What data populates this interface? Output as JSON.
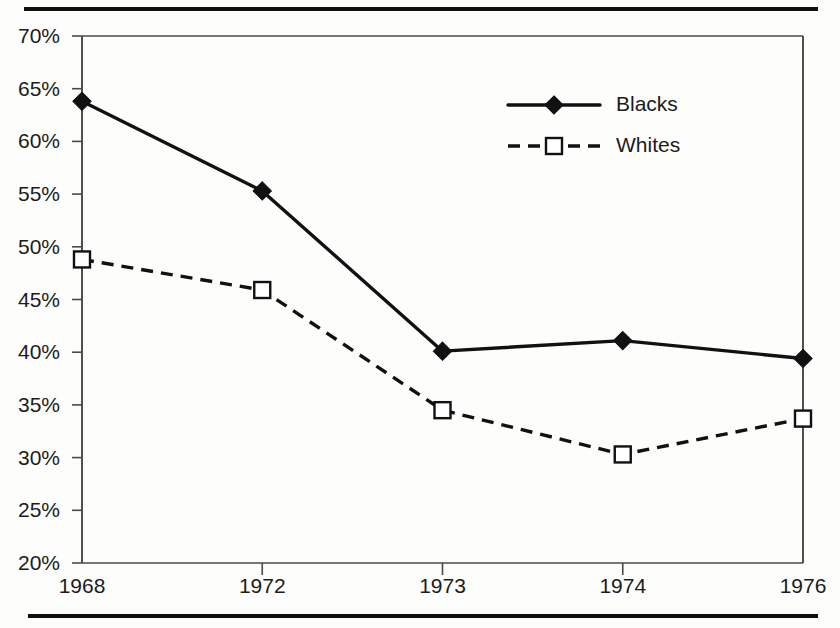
{
  "chart_data": {
    "type": "line",
    "title": "",
    "xlabel": "",
    "ylabel": "",
    "categories": [
      "1968",
      "1972",
      "1973",
      "1974",
      "1976"
    ],
    "series": [
      {
        "name": "Blacks",
        "values": [
          63.8,
          55.3,
          40.1,
          41.1,
          39.4
        ],
        "line_style": "solid",
        "marker": "filled-diamond",
        "color": "#111111"
      },
      {
        "name": "Whites",
        "values": [
          48.8,
          45.9,
          34.5,
          30.3,
          33.7
        ],
        "line_style": "dashed",
        "marker": "open-square",
        "color": "#111111"
      }
    ],
    "ylim": [
      20,
      70
    ],
    "ytick_step": 5,
    "ytick_labels": [
      "70%",
      "65%",
      "60%",
      "55%",
      "50%",
      "45%",
      "40%",
      "35%",
      "30%",
      "25%",
      "20%"
    ],
    "ytick_values": [
      70,
      65,
      60,
      55,
      50,
      45,
      40,
      35,
      30,
      25,
      20
    ],
    "grid": false,
    "legend_position": "inside-top-right",
    "axis_color": "#4a4a4a"
  },
  "legend": {
    "entries": [
      {
        "label": "Blacks"
      },
      {
        "label": "Whites"
      }
    ]
  }
}
